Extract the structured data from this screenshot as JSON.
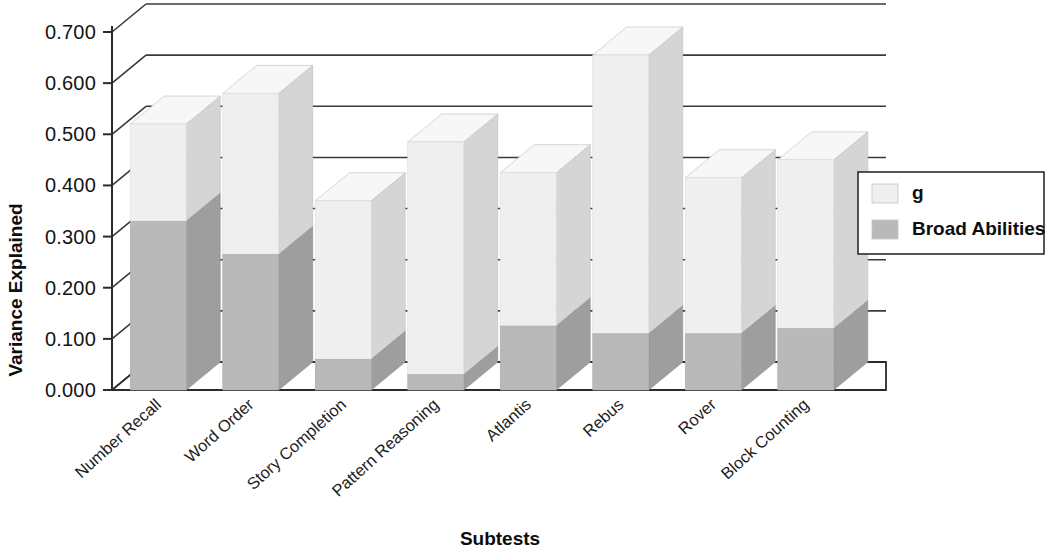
{
  "chart_data": {
    "type": "bar",
    "subtype": "stacked-3d-column",
    "title": "",
    "xlabel": "Subtests",
    "ylabel": "Variance Explained",
    "categories": [
      "Number Recall",
      "Word Order",
      "Story Completion",
      "Pattern Reasoning",
      "Atlantis",
      "Rebus",
      "Rover",
      "Block Counting"
    ],
    "series": [
      {
        "name": "Broad Abilities",
        "color": "#b9b9b9",
        "values": [
          0.33,
          0.265,
          0.06,
          0.03,
          0.125,
          0.11,
          0.11,
          0.12
        ]
      },
      {
        "name": "g",
        "color": "#efefef",
        "values": [
          0.19,
          0.315,
          0.31,
          0.455,
          0.3,
          0.545,
          0.305,
          0.33
        ]
      }
    ],
    "totals": [
      0.52,
      0.58,
      0.37,
      0.485,
      0.425,
      0.655,
      0.415,
      0.45
    ],
    "ylim": [
      0.0,
      0.7
    ],
    "yticks": [
      "0.000",
      "0.100",
      "0.200",
      "0.300",
      "0.400",
      "0.500",
      "0.600",
      "0.700"
    ],
    "ytick_values": [
      0.0,
      0.1,
      0.2,
      0.3,
      0.4,
      0.5,
      0.6,
      0.7
    ],
    "grid": true,
    "legend_position": "right",
    "stack_order_bottom_to_top": [
      "Broad Abilities",
      "g"
    ]
  },
  "legend": {
    "entries": [
      {
        "label": "g",
        "swatch": "#efefef"
      },
      {
        "label": "Broad Abilities",
        "swatch": "#b9b9b9"
      }
    ]
  },
  "colors": {
    "series_g_front": "#efefef",
    "series_g_side": "#d5d5d5",
    "series_g_top": "#f7f7f7",
    "series_broad_front": "#b9b9b9",
    "series_broad_side": "#9e9e9e",
    "axis": "#2b2b2b",
    "text": "#0d0d0d",
    "background": "#ffffff"
  }
}
